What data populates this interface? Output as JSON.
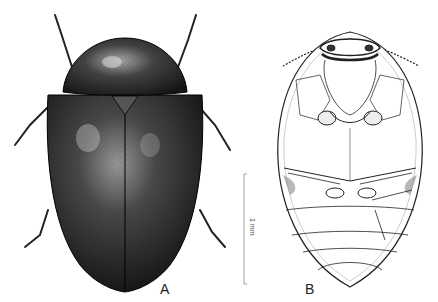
{
  "figure": {
    "panel_a_label": "A",
    "panel_b_label": "B",
    "scale_bar_label": "1 mm",
    "panel_a_view": "dorsal habitus",
    "panel_b_view": "ventral habitus"
  }
}
